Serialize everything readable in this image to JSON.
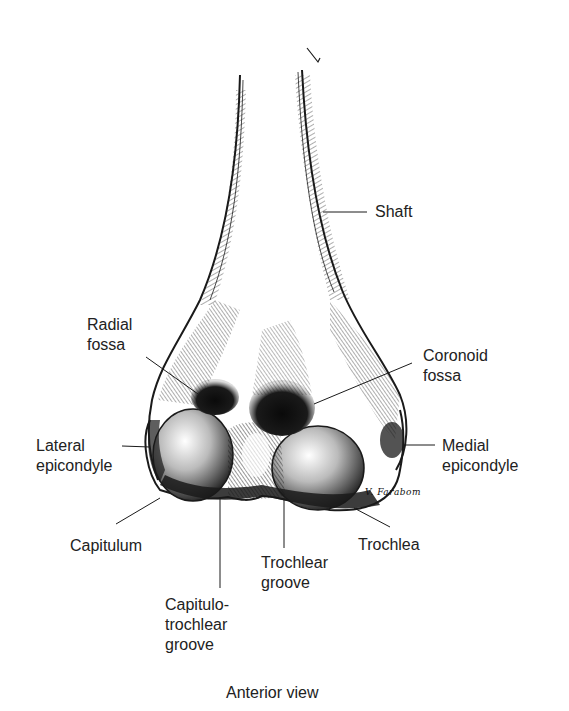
{
  "figure": {
    "view_caption": "Anterior view",
    "signature": "V. Farabom",
    "ink_color": "#1a1a1a",
    "background": "#ffffff"
  },
  "labels": [
    {
      "id": "shaft",
      "text": "Shaft"
    },
    {
      "id": "radial-fossa",
      "text": "Radial\nfossa"
    },
    {
      "id": "coronoid-fossa",
      "text": "Coronoid\nfossa"
    },
    {
      "id": "lateral-epicondyle",
      "text": "Lateral\nepicondyle"
    },
    {
      "id": "medial-epicondyle",
      "text": "Medial\nepicondyle"
    },
    {
      "id": "capitulum",
      "text": "Capitulum"
    },
    {
      "id": "trochlea",
      "text": "Trochlea"
    },
    {
      "id": "trochlear-groove",
      "text": "Trochlear\ngroove"
    },
    {
      "id": "capitulotrochlear-groove",
      "text": "Capitulo-\ntrochlear\ngroove"
    }
  ]
}
